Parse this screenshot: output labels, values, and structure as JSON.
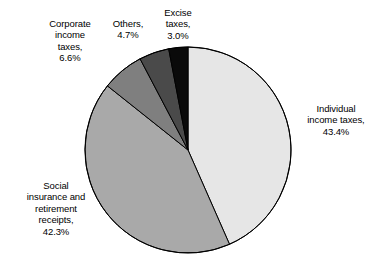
{
  "chart_data": {
    "type": "pie",
    "title": "",
    "subtitle": "",
    "xlabel": "",
    "ylabel": "",
    "legend_position": "none",
    "grid": false,
    "units": "percent",
    "start_angle_deg": 0,
    "direction": "clockwise",
    "categories": [
      "Individual income taxes",
      "Social insurance and retirement receipts",
      "Corporate income taxes",
      "Others",
      "Excise taxes"
    ],
    "values": [
      43.4,
      42.3,
      6.6,
      4.7,
      3.0
    ],
    "value_labels": [
      "43.4%",
      "42.3%",
      "6.6%",
      "4.7%",
      "3.0%"
    ],
    "colors": [
      "#e6e6e6",
      "#a9a9a9",
      "#7f7f7f",
      "#4a4a4a",
      "#0a0a0a"
    ],
    "slices": [
      {
        "name": "Individual income taxes",
        "label_text": "Individual\nincome taxes,\n43.4%",
        "value": 43.4,
        "value_label": "43.4%",
        "color": "#e6e6e6",
        "start_angle_deg": 0,
        "end_angle_deg": 156.24
      },
      {
        "name": "Social insurance and retirement receipts",
        "label_text": "Social\ninsurance and\nretirement\nreceipts,\n42.3%",
        "value": 42.3,
        "value_label": "42.3%",
        "color": "#a9a9a9",
        "start_angle_deg": 156.24,
        "end_angle_deg": 308.52
      },
      {
        "name": "Corporate income taxes",
        "label_text": "Corporate\nincome\ntaxes,\n6.6%",
        "value": 6.6,
        "value_label": "6.6%",
        "color": "#7f7f7f",
        "start_angle_deg": 308.52,
        "end_angle_deg": 332.28
      },
      {
        "name": "Others",
        "label_text": "Others,\n4.7%",
        "value": 4.7,
        "value_label": "4.7%",
        "color": "#4a4a4a",
        "start_angle_deg": 332.28,
        "end_angle_deg": 349.2
      },
      {
        "name": "Excise taxes",
        "label_text": "Excise\ntaxes,\n3.0%",
        "value": 3.0,
        "value_label": "3.0%",
        "color": "#0a0a0a",
        "start_angle_deg": 349.2,
        "end_angle_deg": 360
      }
    ],
    "geometry": {
      "center_x": 188,
      "center_y": 150,
      "radius": 103,
      "outline_color": "#000000",
      "outline_width": 1
    },
    "background_color": "#ffffff"
  },
  "labels": {
    "individual": "Individual\nincome taxes,\n43.4%",
    "social": "Social\ninsurance and\nretirement\nreceipts,\n42.3%",
    "corporate": "Corporate\nincome\ntaxes,\n6.6%",
    "others": "Others,\n4.7%",
    "excise": "Excise\ntaxes,\n3.0%"
  }
}
